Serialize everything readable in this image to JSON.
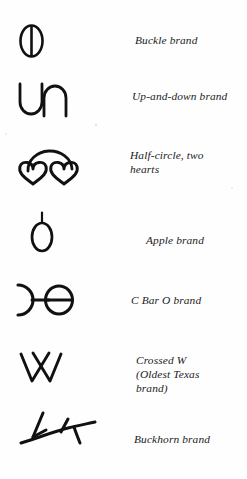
{
  "figure": {
    "background_color": "#fefefe",
    "ink_color": "#111111",
    "text_color": "#1b1b1b",
    "columns": [
      "brand-symbol",
      "brand-name"
    ]
  },
  "brands": [
    {
      "icon": "buckle-brand-icon",
      "caption": "Buckle brand",
      "shape_description": "upright oval with a vertical bar through its center"
    },
    {
      "icon": "up-and-down-brand-icon",
      "caption": "Up-and-down brand",
      "shape_description": "a U beside an inverted U"
    },
    {
      "icon": "half-circle-two-hearts-brand-icon",
      "caption": "Half-circle, two\nhearts",
      "shape_description": "two outlined hearts with a half-circle arc arching over them"
    },
    {
      "icon": "apple-brand-icon",
      "caption": "Apple brand",
      "shape_description": "oval body with a short vertical stem on top"
    },
    {
      "icon": "c-bar-o-brand-icon",
      "caption": "C Bar O brand",
      "shape_description": "reversed C, a horizontal bar, and an O crossed by a bar"
    },
    {
      "icon": "crossed-w-brand-icon",
      "caption": "Crossed W\n(Oldest Texas\nbrand)",
      "shape_description": "a W whose middle strokes cross above the baseline"
    },
    {
      "icon": "buckhorn-brand-icon",
      "caption": "Buckhorn brand",
      "shape_description": "curved antler with two upward prongs"
    }
  ]
}
